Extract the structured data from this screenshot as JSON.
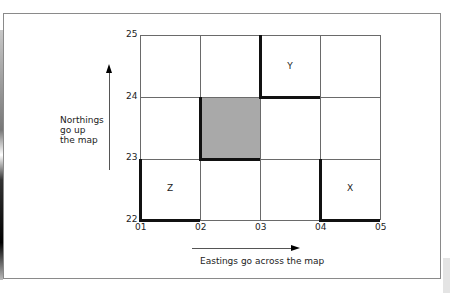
{
  "diagram": {
    "northings_label": [
      "Northings",
      "go up",
      "the map"
    ],
    "eastings_label": "Eastings go across the map",
    "y_ticks": [
      "25",
      "24",
      "23",
      "22"
    ],
    "x_ticks": [
      "01",
      "02",
      "03",
      "04",
      "05"
    ],
    "cells": [
      {
        "label": "Y",
        "easting": "03",
        "northing": "24"
      },
      {
        "label": "Z",
        "easting": "01",
        "northing": "22"
      },
      {
        "label": "X",
        "easting": "04",
        "northing": "22"
      }
    ],
    "shaded_square": {
      "easting": "02",
      "northing": "23",
      "color": "#a9a9a9"
    },
    "grid": {
      "columns": 4,
      "rows": 3
    }
  }
}
